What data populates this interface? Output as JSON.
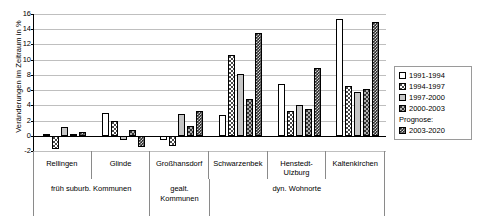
{
  "chart_data": {
    "type": "bar",
    "title": "",
    "xlabel": "",
    "ylabel": "Veränderungen im Zeitraum in %",
    "ylim": [
      -2,
      16
    ],
    "yticks": [
      16,
      14,
      12,
      10,
      8,
      6,
      4,
      2,
      0,
      -2
    ],
    "grid": true,
    "legend_position": "right",
    "legend_note": "Prognose:",
    "categories": [
      "Rellingen",
      "Glinde",
      "Großhansdorf",
      "Schwarzenbek",
      "Henstedt-Ulzburg",
      "Kaltenkirchen"
    ],
    "category_groups": [
      {
        "label": "früh suburb. Kommunen",
        "span": 2
      },
      {
        "label": "gealt. Kommunen",
        "span": 1
      },
      {
        "label": "dyn. Wohnorte",
        "span": 3
      }
    ],
    "series": [
      {
        "name": "1991-1994",
        "pattern": "p1",
        "values": [
          0.15,
          3.0,
          -0.5,
          2.7,
          6.8,
          15.4
        ]
      },
      {
        "name": "1994-1997",
        "pattern": "p2",
        "values": [
          -1.7,
          2.0,
          -1.4,
          10.6,
          3.2,
          6.6
        ]
      },
      {
        "name": "1997-2000",
        "pattern": "p3",
        "values": [
          1.2,
          -0.6,
          2.8,
          8.1,
          4.0,
          5.7
        ]
      },
      {
        "name": "2000-2003",
        "pattern": "p4",
        "values": [
          0.05,
          0.8,
          1.3,
          4.9,
          3.5,
          6.1
        ]
      },
      {
        "name": "2003-2020",
        "pattern": "p5",
        "values": [
          0.5,
          -1.5,
          3.3,
          13.5,
          8.9,
          15.0
        ]
      }
    ]
  }
}
